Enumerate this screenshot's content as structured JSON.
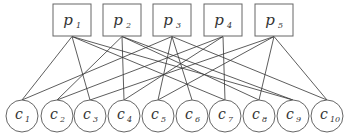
{
  "diagram": {
    "type": "bipartite-graph",
    "top_nodes": [
      {
        "id": "p1",
        "label": "p",
        "sub": "1",
        "x": 72
      },
      {
        "id": "p2",
        "label": "p",
        "sub": "2",
        "x": 122
      },
      {
        "id": "p3",
        "label": "p",
        "sub": "3",
        "x": 172
      },
      {
        "id": "p4",
        "label": "p",
        "sub": "4",
        "x": 223
      },
      {
        "id": "p5",
        "label": "p",
        "sub": "5",
        "x": 274
      }
    ],
    "bottom_nodes": [
      {
        "id": "c1",
        "label": "c",
        "sub": "1",
        "x": 22
      },
      {
        "id": "c2",
        "label": "c",
        "sub": "2",
        "x": 57
      },
      {
        "id": "c3",
        "label": "c",
        "sub": "3",
        "x": 90
      },
      {
        "id": "c4",
        "label": "c",
        "sub": "4",
        "x": 124
      },
      {
        "id": "c5",
        "label": "c",
        "sub": "5",
        "x": 158
      },
      {
        "id": "c6",
        "label": "c",
        "sub": "6",
        "x": 192
      },
      {
        "id": "c7",
        "label": "c",
        "sub": "7",
        "x": 225
      },
      {
        "id": "c8",
        "label": "c",
        "sub": "8",
        "x": 259
      },
      {
        "id": "c9",
        "label": "c",
        "sub": "9",
        "x": 293
      },
      {
        "id": "c10",
        "label": "c",
        "sub": "10",
        "x": 327
      }
    ],
    "edges": [
      [
        "p1",
        "c1"
      ],
      [
        "p1",
        "c3"
      ],
      [
        "p1",
        "c7"
      ],
      [
        "p1",
        "c9"
      ],
      [
        "p2",
        "c2"
      ],
      [
        "p2",
        "c4"
      ],
      [
        "p2",
        "c8"
      ],
      [
        "p2",
        "c9"
      ],
      [
        "p3",
        "c1"
      ],
      [
        "p3",
        "c5"
      ],
      [
        "p3",
        "c6"
      ],
      [
        "p3",
        "c10"
      ],
      [
        "p4",
        "c2"
      ],
      [
        "p4",
        "c4"
      ],
      [
        "p4",
        "c7"
      ],
      [
        "p5",
        "c3"
      ],
      [
        "p5",
        "c5"
      ],
      [
        "p5",
        "c8"
      ],
      [
        "p5",
        "c10"
      ]
    ],
    "style": {
      "stroke": "#333333",
      "node_fill": "#ffffff",
      "box_stroke": "#666666"
    }
  }
}
